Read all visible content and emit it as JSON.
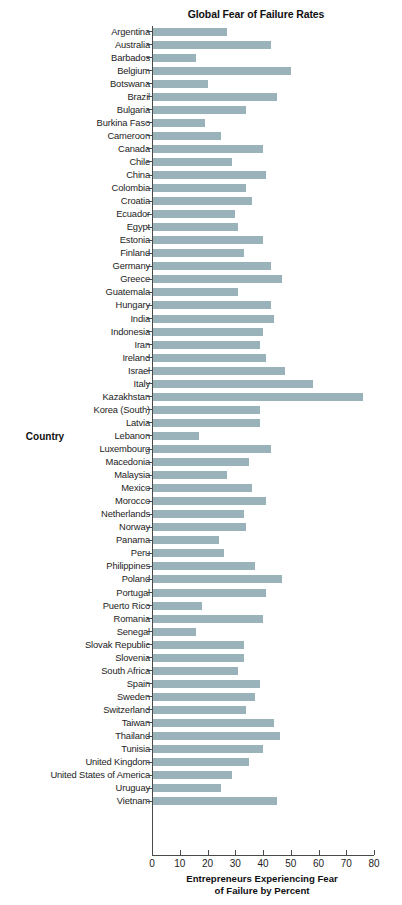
{
  "chart_data": {
    "type": "bar",
    "orientation": "horizontal",
    "title": "Global Fear of Failure Rates",
    "xlabel_line1": "Entrepreneurs Experiencing Fear",
    "xlabel_line2": "of Failure by Percent",
    "ylabel": "Country",
    "xlim": [
      0,
      80
    ],
    "xticks": [
      0,
      10,
      20,
      30,
      40,
      50,
      60,
      70,
      80
    ],
    "grid": false,
    "legend": null,
    "bar_color": "#9ab3bb",
    "axis_color": "#4a4a4a",
    "categories": [
      "Argentina",
      "Australia",
      "Barbados",
      "Belgium",
      "Botswana",
      "Brazil",
      "Bulgaria",
      "Burkina Faso",
      "Cameroon",
      "Canada",
      "Chile",
      "China",
      "Colombia",
      "Croatia",
      "Ecuador",
      "Egypt",
      "Estonia",
      "Finland",
      "Germany",
      "Greece",
      "Guatemala",
      "Hungary",
      "India",
      "Indonesia",
      "Iran",
      "Ireland",
      "Israel",
      "Italy",
      "Kazakhstan",
      "Korea (South)",
      "Latvia",
      "Lebanon",
      "Luxembourg",
      "Macedonia",
      "Malaysia",
      "Mexico",
      "Morocco",
      "Netherlands",
      "Norway",
      "Panama",
      "Peru",
      "Philippines",
      "Poland",
      "Portugal",
      "Puerto Rico",
      "Romania",
      "Senegal",
      "Slovak Republic",
      "Slovenia",
      "South Africa",
      "Spain",
      "Sweden",
      "Switzerland",
      "Taiwan",
      "Thailand",
      "Tunisia",
      "United Kingdom",
      "United States of America",
      "Uruguay",
      "Vietnam"
    ],
    "values": [
      27,
      43,
      16,
      50,
      20,
      45,
      34,
      19,
      25,
      40,
      29,
      41,
      34,
      36,
      30,
      31,
      40,
      33,
      43,
      47,
      31,
      43,
      44,
      40,
      39,
      41,
      48,
      58,
      76,
      39,
      39,
      17,
      43,
      35,
      27,
      36,
      41,
      33,
      34,
      24,
      26,
      37,
      47,
      41,
      18,
      40,
      16,
      33,
      33,
      31,
      39,
      37,
      34,
      44,
      46,
      40,
      35,
      29,
      25,
      45
    ]
  },
  "top_sliver_text": ""
}
